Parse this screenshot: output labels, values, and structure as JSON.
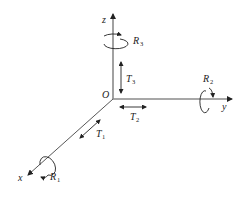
{
  "diagram": {
    "origin_label": "O",
    "axes": [
      {
        "name": "x",
        "label": "x"
      },
      {
        "name": "y",
        "label": "y"
      },
      {
        "name": "z",
        "label": "z"
      }
    ],
    "translations": [
      {
        "id": "T1",
        "letter": "T",
        "sub": "1",
        "axis": "x"
      },
      {
        "id": "T2",
        "letter": "T",
        "sub": "2",
        "axis": "y"
      },
      {
        "id": "T3",
        "letter": "T",
        "sub": "3",
        "axis": "z"
      }
    ],
    "rotations": [
      {
        "id": "R1",
        "letter": "R",
        "sub": "1",
        "axis": "x"
      },
      {
        "id": "R2",
        "letter": "R",
        "sub": "2",
        "axis": "y"
      },
      {
        "id": "R3",
        "letter": "R",
        "sub": "3",
        "axis": "z"
      }
    ],
    "colors": {
      "axis": "#7a7a7a",
      "ink": "#222222"
    }
  }
}
